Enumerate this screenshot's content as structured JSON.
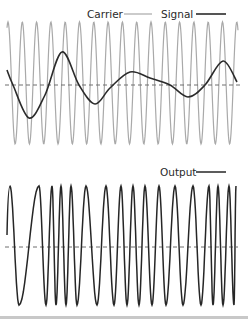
{
  "colors": {
    "carrier": "#a9a9a9",
    "signal": "#2b2b2b",
    "output": "#262626",
    "baseline": "#6e6e6e",
    "background": "#ffffff"
  },
  "legend": {
    "carrier_label": "Carrier",
    "signal_label": "Signal",
    "output_label": "Output"
  },
  "chart_data": [
    {
      "type": "line",
      "title": "",
      "panel": "top",
      "legend_position": "top-right",
      "grid": false,
      "series": [
        {
          "name": "Carrier",
          "kind": "sine",
          "peaks_count": 17,
          "x_range": [
            7,
            238
          ],
          "period_px": 14.3,
          "first_peak_x": 8,
          "amplitude_px": 61,
          "center_y": 83
        },
        {
          "name": "Signal",
          "kind": "smooth-curve",
          "points": [
            [
              7,
              70
            ],
            [
              13,
              85
            ],
            [
              29,
              118
            ],
            [
              45,
              95
            ],
            [
              62,
              52
            ],
            [
              79,
              85
            ],
            [
              95,
              104
            ],
            [
              110,
              88
            ],
            [
              130,
              72
            ],
            [
              150,
              78
            ],
            [
              170,
              85
            ],
            [
              188,
              97
            ],
            [
              205,
              85
            ],
            [
              223,
              61
            ],
            [
              237,
              82
            ]
          ]
        }
      ],
      "baseline_y": 85
    },
    {
      "type": "line",
      "title": "",
      "panel": "bottom",
      "legend_position": "top-right",
      "grid": false,
      "series": [
        {
          "name": "Output",
          "kind": "fm-wave",
          "start": [
            7,
            235
          ],
          "top_y": 186,
          "bottom_y": 305,
          "extrema_x": [
            10,
            19,
            39,
            46,
            52,
            56,
            61,
            66,
            71,
            77,
            86,
            97,
            106,
            114,
            121,
            127,
            133,
            139,
            145,
            152,
            159,
            166,
            175,
            183,
            193,
            201,
            209,
            213,
            218,
            223,
            229,
            234
          ],
          "first_is_peak": true,
          "end": [
            236,
            305
          ]
        }
      ],
      "baseline_y": 247
    }
  ]
}
